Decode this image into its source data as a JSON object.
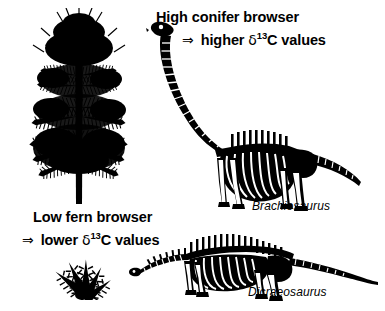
{
  "figure": {
    "background_color": "#ffffff",
    "ink_color": "#000000",
    "width": 385,
    "height": 311
  },
  "top_group": {
    "caption_line_1": "High conifer browser",
    "arrow": "⇒",
    "caption_line_2_pre": "higher ",
    "delta_symbol": "δ",
    "isotope_superscript": "13",
    "isotope_element": "C values",
    "species_label": "Brachiosaurus",
    "plant_icon": "conifer-tree-silhouette",
    "skeleton_icon": "brachiosaurus-skeleton"
  },
  "bottom_group": {
    "caption_line_1": "Low fern browser",
    "arrow": "⇒",
    "caption_line_2_pre": "lower ",
    "delta_symbol": "δ",
    "isotope_superscript": "13",
    "isotope_element": "C values",
    "species_label": "Dicraeosaurus",
    "plant_icon": "fern-silhouette",
    "skeleton_icon": "dicraeosaurus-skeleton"
  }
}
